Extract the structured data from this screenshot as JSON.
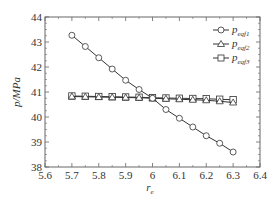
{
  "chart_data": {
    "type": "line",
    "title": "",
    "xlabel": "r",
    "xlabel_sub": "e",
    "ylabel": "p/MPa",
    "xlim": [
      5.6,
      6.4
    ],
    "ylim": [
      38,
      44
    ],
    "xticks": [
      "5.6",
      "5.7",
      "5.8",
      "5.9",
      "6",
      "6.1",
      "6.2",
      "6.3",
      "6.4"
    ],
    "yticks": [
      "38",
      "39",
      "40",
      "41",
      "42",
      "43",
      "44"
    ],
    "grid": false,
    "legend_position": "upper right",
    "x": [
      5.7,
      5.75,
      5.8,
      5.85,
      5.9,
      5.95,
      6.0,
      6.05,
      6.1,
      6.15,
      6.2,
      6.25,
      6.3
    ],
    "series": [
      {
        "name": "p_eqf1",
        "label_main": "p",
        "label_sub": "eqf1",
        "marker": "circle",
        "values": [
          43.27,
          42.82,
          42.37,
          41.92,
          41.47,
          41.1,
          40.75,
          40.3,
          39.95,
          39.6,
          39.25,
          38.95,
          38.6
        ]
      },
      {
        "name": "p_eqf2",
        "label_main": "p",
        "label_sub": "eqf2",
        "marker": "triangle",
        "values": [
          40.82,
          40.81,
          40.8,
          40.79,
          40.78,
          40.77,
          40.75,
          40.73,
          40.71,
          40.69,
          40.67,
          40.63,
          40.58
        ]
      },
      {
        "name": "p_eqf3",
        "label_main": "p",
        "label_sub": "eqf3",
        "marker": "square",
        "values": [
          40.84,
          40.83,
          40.82,
          40.81,
          40.8,
          40.79,
          40.77,
          40.76,
          40.75,
          40.74,
          40.73,
          40.71,
          40.69
        ]
      }
    ]
  },
  "legend": {
    "items": [
      {
        "main": "p",
        "sub": "eqf1"
      },
      {
        "main": "p",
        "sub": "eqf2"
      },
      {
        "main": "p",
        "sub": "eqf3"
      }
    ]
  },
  "axes": {
    "ylabel": "p/MPa",
    "xlabel_main": "r",
    "xlabel_sub": "e"
  }
}
